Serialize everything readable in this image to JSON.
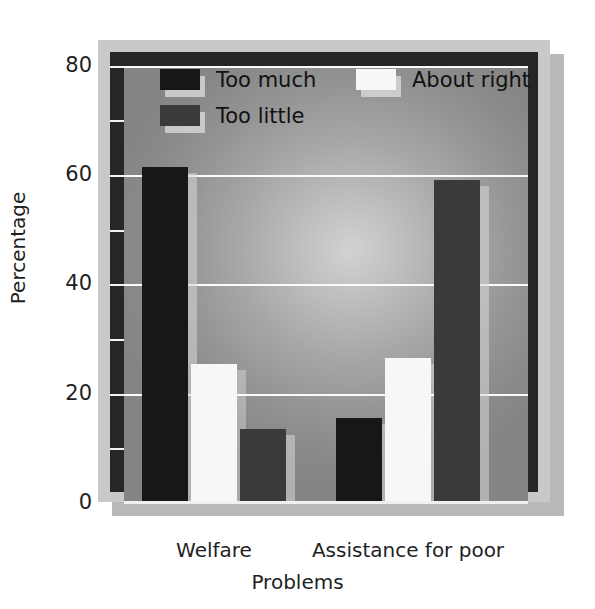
{
  "chart_data": {
    "type": "bar",
    "title": "",
    "subtitle": "",
    "xlabel": "Problems",
    "ylabel": "Percentage",
    "categories": [
      "Welfare",
      "Assistance for poor"
    ],
    "series": [
      {
        "name": "Too much",
        "color": "#171717",
        "values": [
          61.5,
          15.5
        ]
      },
      {
        "name": "About right",
        "color": "#f7f7f7",
        "values": [
          25.5,
          26.5
        ]
      },
      {
        "name": "Too little",
        "color": "#3a3a3a",
        "values": [
          13.5,
          59.0
        ]
      }
    ],
    "ylim": [
      0,
      80
    ],
    "yticks": [
      0,
      20,
      40,
      60,
      80
    ],
    "ytick_labels": [
      "0",
      "20",
      "40",
      "60",
      "80"
    ],
    "y_minor_ticks": [
      10,
      30,
      50,
      70
    ],
    "grid": true,
    "grid_color": "#fbfbfb",
    "legend_position": "inside-top",
    "plot_background": "#a0a0a0",
    "frame_color": "#c9c9c9",
    "wall_color": "#262626",
    "shadow_color": "#b9b9b9"
  },
  "axes": {
    "y_label": "Percentage",
    "x_label": "Problems",
    "y_ticks": [
      {
        "label": "80",
        "value": 80
      },
      {
        "label": "60",
        "value": 60
      },
      {
        "label": "40",
        "value": 40
      },
      {
        "label": "20",
        "value": 20
      },
      {
        "label": "0",
        "value": 0
      }
    ],
    "x_ticks": [
      {
        "label": "Welfare"
      },
      {
        "label": "Assistance for poor"
      }
    ]
  },
  "legend": {
    "items": [
      {
        "label": "Too much",
        "color": "#171717"
      },
      {
        "label": "About right",
        "color": "#f7f7f7"
      },
      {
        "label": "Too little",
        "color": "#3a3a3a"
      }
    ]
  }
}
